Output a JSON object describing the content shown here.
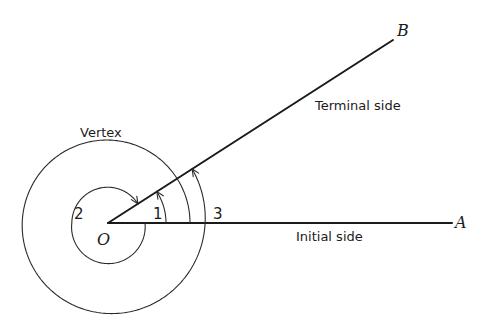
{
  "diagram": {
    "type": "angle-definition",
    "labels": {
      "vertex_caption": "Vertex",
      "terminal_caption": "Terminal side",
      "initial_caption": "Initial side",
      "origin": "O",
      "point_a": "A",
      "point_b": "B",
      "angle_1": "1",
      "angle_2": "2",
      "angle_3": "3"
    },
    "angles": [
      {
        "id": "1",
        "direction": "counterclockwise",
        "turns": "less than one revolution"
      },
      {
        "id": "2",
        "direction": "clockwise",
        "turns": "less than one revolution (negative angle)"
      },
      {
        "id": "3",
        "direction": "counterclockwise",
        "turns": "more than one revolution"
      }
    ],
    "colors": {
      "line": "#1a1a1a",
      "background": "#ffffff"
    }
  }
}
